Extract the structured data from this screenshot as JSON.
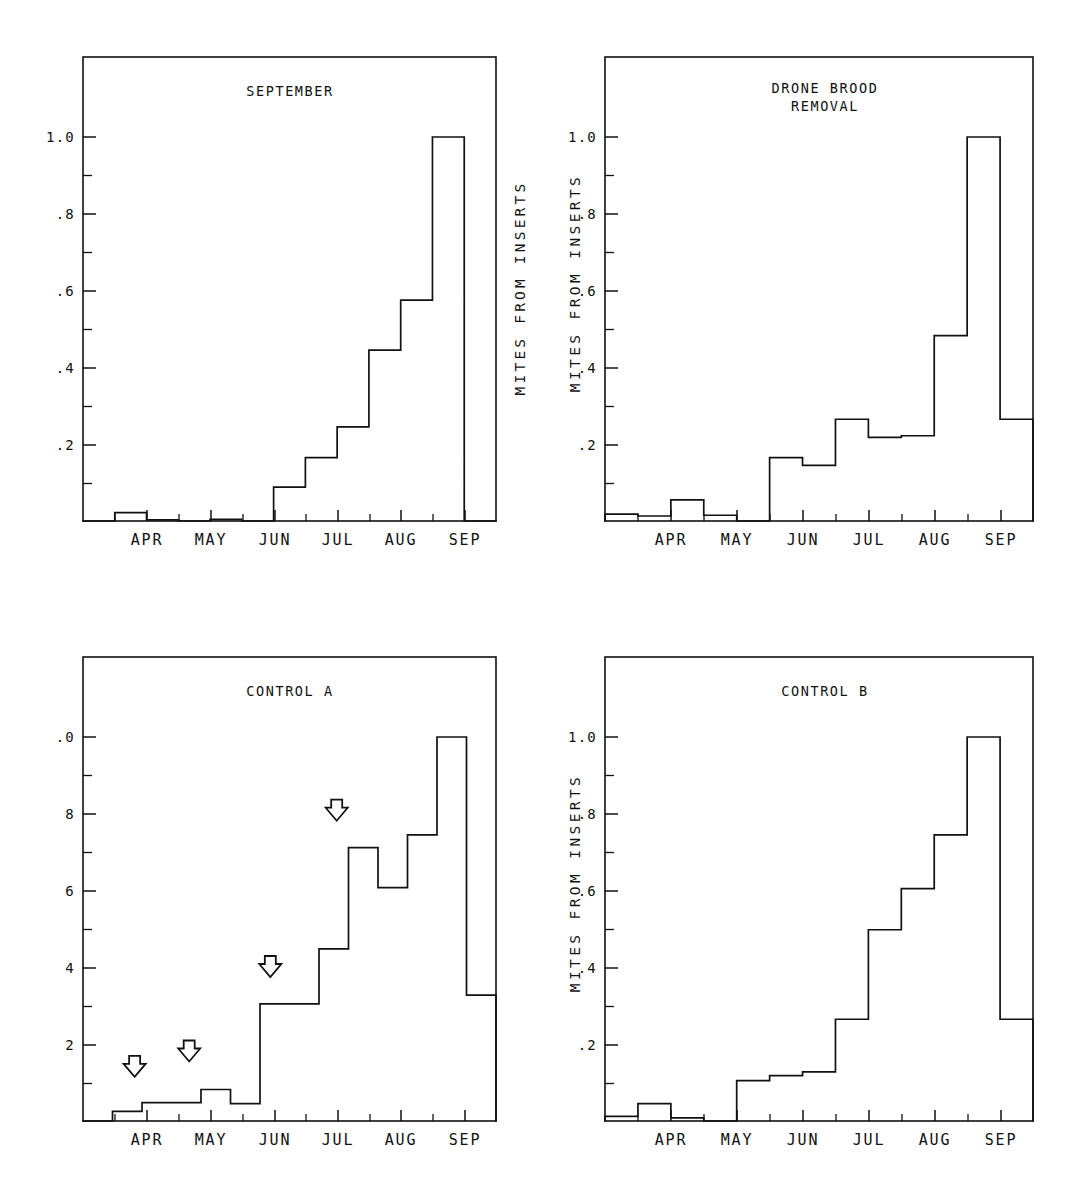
{
  "figure": {
    "background": "#ffffff",
    "ink_color": "#111111",
    "panel_count": 4
  },
  "chart_data": [
    {
      "id": "september",
      "type": "line",
      "subtype": "step-histogram",
      "title": "SEPTEMBER",
      "panel_position": "top-left",
      "xlabel": "",
      "ylabel": "",
      "ylabel_visible": false,
      "xlim": [
        0,
        13
      ],
      "ylim": [
        0,
        1.15
      ],
      "ytick_labels": [
        "1.0",
        ".8",
        ".6",
        ".4",
        ".2"
      ],
      "ytick_values": [
        1.0,
        0.8,
        0.6,
        0.4,
        0.2
      ],
      "yminor_values": [
        0.9,
        0.7,
        0.5,
        0.3,
        0.1
      ],
      "xtick_labels": [
        "APR",
        "MAY",
        "JUN",
        "JUL",
        "AUG",
        "SEP"
      ],
      "grid": false,
      "legend": false,
      "bin_edges": [
        0,
        1,
        2,
        3,
        4,
        5,
        6,
        7,
        8,
        9,
        10,
        11,
        12,
        13
      ],
      "values": [
        0.0,
        0.022,
        0.003,
        0.0,
        0.004,
        0.0,
        0.088,
        0.165,
        0.245,
        0.445,
        0.575,
        1.0,
        0.0
      ],
      "annotations": []
    },
    {
      "id": "drone-brood-removal",
      "type": "line",
      "subtype": "step-histogram",
      "title": "DRONE BROOD\nREMOVAL",
      "title_lines": [
        "DRONE BROOD",
        "REMOVAL"
      ],
      "panel_position": "top-right",
      "xlabel": "",
      "ylabel": "MITES FROM INSERTS",
      "ylabel_visible": true,
      "xlim": [
        0,
        13
      ],
      "ylim": [
        0,
        1.15
      ],
      "ytick_labels": [
        "1.0",
        ".8",
        ".6",
        ".4",
        ".2"
      ],
      "ytick_values": [
        1.0,
        0.8,
        0.6,
        0.4,
        0.2
      ],
      "yminor_values": [
        0.9,
        0.7,
        0.5,
        0.3,
        0.1
      ],
      "xtick_labels": [
        "APR",
        "MAY",
        "JUN",
        "JUL",
        "AUG",
        "SEP"
      ],
      "grid": false,
      "legend": false,
      "bin_edges": [
        0,
        1,
        2,
        3,
        4,
        5,
        6,
        7,
        8,
        9,
        10,
        11,
        12,
        13
      ],
      "values": [
        0.018,
        0.013,
        0.055,
        0.015,
        0.0,
        0.165,
        0.145,
        0.265,
        0.218,
        0.222,
        0.483,
        1.0,
        0.265
      ],
      "annotations": []
    },
    {
      "id": "control-a",
      "type": "line",
      "subtype": "step-histogram",
      "title": "CONTROL A",
      "panel_position": "bottom-left",
      "xlabel": "",
      "ylabel": "",
      "ylabel_visible": false,
      "xlim": [
        0,
        13
      ],
      "ylim": [
        0,
        1.15
      ],
      "ytick_labels": [
        ".0",
        "8",
        "6",
        "4",
        "2"
      ],
      "ytick_labels_note": "left-truncated in the scan; full labels are 1.0 .8 .6 .4 .2",
      "ytick_values": [
        1.0,
        0.8,
        0.6,
        0.4,
        0.2
      ],
      "yminor_values": [
        0.9,
        0.7,
        0.5,
        0.3,
        0.1
      ],
      "xtick_labels": [
        "APR",
        "MAY",
        "JUN",
        "JUL",
        "AUG",
        "SEP"
      ],
      "grid": false,
      "legend": false,
      "bin_edges": [
        0,
        1,
        2,
        3,
        4,
        5,
        6,
        7,
        8,
        9,
        10,
        11,
        12,
        13
      ],
      "values": [
        0.0,
        0.025,
        0.048,
        0.048,
        0.082,
        0.045,
        0.305,
        0.305,
        0.448,
        0.712,
        0.608,
        0.745,
        1.0,
        0.328
      ],
      "annotations": [
        {
          "type": "down-arrow",
          "x_bin": 1.75,
          "y": 0.115
        },
        {
          "type": "down-arrow",
          "x_bin": 3.6,
          "y": 0.155
        },
        {
          "type": "down-arrow",
          "x_bin": 6.35,
          "y": 0.375
        },
        {
          "type": "down-arrow",
          "x_bin": 8.6,
          "y": 0.782
        }
      ]
    },
    {
      "id": "control-b",
      "type": "line",
      "subtype": "step-histogram",
      "title": "CONTROL B",
      "panel_position": "bottom-right",
      "xlabel": "",
      "ylabel": "MITES FROM INSERTS",
      "ylabel_visible": true,
      "xlim": [
        0,
        13
      ],
      "ylim": [
        0,
        1.15
      ],
      "ytick_labels": [
        "1.0",
        ".8",
        ".6",
        ".4",
        ".2"
      ],
      "ytick_values": [
        1.0,
        0.8,
        0.6,
        0.4,
        0.2
      ],
      "yminor_values": [
        0.9,
        0.7,
        0.5,
        0.3,
        0.1
      ],
      "xtick_labels": [
        "APR",
        "MAY",
        "JUN",
        "JUL",
        "AUG",
        "SEP"
      ],
      "grid": false,
      "legend": false,
      "bin_edges": [
        0,
        1,
        2,
        3,
        4,
        5,
        6,
        7,
        8,
        9,
        10,
        11,
        12,
        13
      ],
      "values": [
        0.012,
        0.045,
        0.008,
        0.0,
        0.105,
        0.118,
        0.128,
        0.265,
        0.498,
        0.605,
        0.745,
        1.0,
        0.265
      ],
      "annotations": []
    }
  ]
}
